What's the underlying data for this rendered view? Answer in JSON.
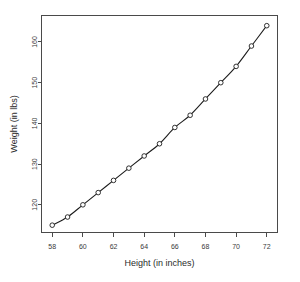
{
  "chart_data": {
    "type": "scatter",
    "title": "",
    "xlabel": "Height (in inches)",
    "ylabel": "Weight (in lbs)",
    "x": [
      58,
      59,
      60,
      61,
      62,
      63,
      64,
      65,
      66,
      67,
      68,
      69,
      70,
      71,
      72
    ],
    "values": [
      115,
      117,
      120,
      123,
      126,
      129,
      132,
      135,
      139,
      142,
      146,
      150,
      154,
      159,
      164
    ],
    "series": [
      {
        "name": "Height vs Weight",
        "x": [
          58,
          59,
          60,
          61,
          62,
          63,
          64,
          65,
          66,
          67,
          68,
          69,
          70,
          71,
          72
        ],
        "values": [
          115,
          117,
          120,
          123,
          126,
          129,
          132,
          135,
          139,
          142,
          146,
          150,
          154,
          159,
          164
        ]
      }
    ],
    "xticks": [
      58,
      60,
      62,
      64,
      66,
      68,
      70,
      72
    ],
    "xtick_labels": [
      "58",
      "60",
      "62",
      "64",
      "66",
      "68",
      "70",
      "72"
    ],
    "yticks": [
      120,
      130,
      140,
      150,
      160
    ],
    "ytick_labels": [
      "120",
      "130",
      "140",
      "150",
      "160"
    ],
    "xlim": [
      57.3,
      72.7
    ],
    "ylim": [
      113.2,
      166.5
    ],
    "grid": false,
    "legend": null,
    "marker": "open-circle",
    "line_style": "solid",
    "colors": {
      "line": "#1c1c1c",
      "marker_edge": "#1c1c1c",
      "marker_fill": "#ffffff",
      "axis": "#4a4a4a",
      "background": "#ffffff"
    }
  },
  "figure": {
    "caption": ""
  }
}
